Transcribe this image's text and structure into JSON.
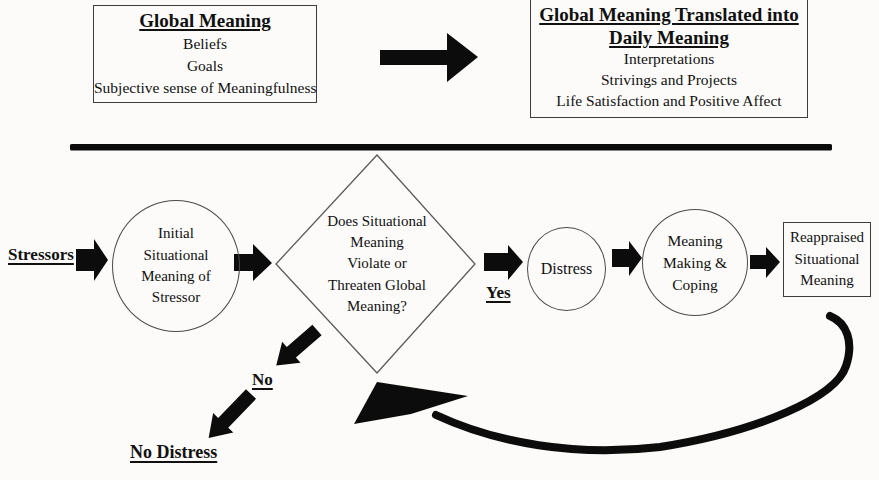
{
  "colors": {
    "ink": "#0c0c0c",
    "box_border": "#3d3d3d",
    "background": "#fcfbf9"
  },
  "top_section": {
    "global_meaning_box": {
      "title": "Global Meaning",
      "items": [
        "Beliefs",
        "Goals",
        "Subjective sense of Meaningfulness"
      ]
    },
    "daily_meaning_box": {
      "title": "Global Meaning Translated into\nDaily Meaning",
      "items": [
        "Interpretations",
        "Strivings and Projects",
        "Life Satisfaction and Positive Affect"
      ]
    }
  },
  "flowchart": {
    "stressors_label": "Stressors",
    "initial_meaning_node": "Initial\nSituational\nMeaning of\nStressor",
    "appraisal_question_node": "Does Situational\nMeaning\nViolate or\nThreaten Global\nMeaning?",
    "yes_label": "Yes",
    "distress_node": "Distress",
    "meaning_making_node": "Meaning\nMaking &\nCoping",
    "reappraised_meaning_node": "Reappraised\nSituational\nMeaning",
    "no_label": "No",
    "no_distress_label": "No Distress"
  }
}
